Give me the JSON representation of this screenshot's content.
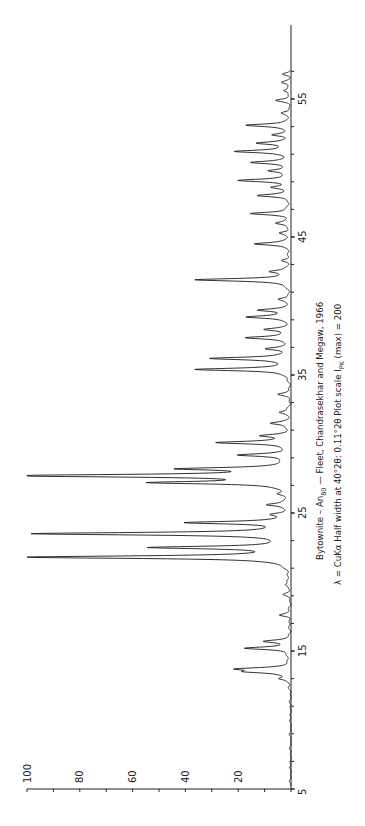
{
  "chart_data": {
    "type": "line",
    "orientation": "rotated-90-ccw",
    "title": "Bytownite – An80 — Fleet, Chandrasekhar and Megaw, 1966",
    "subtitle": "λ = CuKα  Half width at 40°2θ: 0.11°2θ   Plot scale I_PK (max) = 200",
    "xlabel": "2θ (degrees)",
    "ylabel": "Intensity",
    "xlim": [
      5,
      57.5
    ],
    "ylim": [
      0,
      100
    ],
    "x_ticks_major": [
      5,
      15,
      25,
      35,
      45,
      55
    ],
    "x_ticks_minor_step": 2,
    "y_ticks": [
      0,
      10,
      20,
      30,
      40,
      50,
      60,
      70,
      80,
      90,
      100
    ],
    "y_tick_labels": [
      "20",
      "40",
      "60",
      "80",
      "100"
    ],
    "y_tick_label_values": [
      20,
      40,
      60,
      80,
      100
    ],
    "grid": false,
    "legend": null,
    "peaks": [
      {
        "two_theta": 13.0,
        "intensity": 4
      },
      {
        "two_theta": 13.5,
        "intensity": 14
      },
      {
        "two_theta": 13.7,
        "intensity": 18
      },
      {
        "two_theta": 15.2,
        "intensity": 17
      },
      {
        "two_theta": 15.7,
        "intensity": 9
      },
      {
        "two_theta": 17.6,
        "intensity": 4
      },
      {
        "two_theta": 19.1,
        "intensity": 2
      },
      {
        "two_theta": 19.8,
        "intensity": 2
      },
      {
        "two_theta": 21.8,
        "intensity": 100
      },
      {
        "two_theta": 22.5,
        "intensity": 50
      },
      {
        "two_theta": 23.5,
        "intensity": 96
      },
      {
        "two_theta": 24.3,
        "intensity": 38
      },
      {
        "two_theta": 24.9,
        "intensity": 5
      },
      {
        "two_theta": 25.6,
        "intensity": 8
      },
      {
        "two_theta": 26.4,
        "intensity": 3
      },
      {
        "two_theta": 27.2,
        "intensity": 49
      },
      {
        "two_theta": 27.7,
        "intensity": 105,
        "clipped": true
      },
      {
        "two_theta": 28.2,
        "intensity": 38
      },
      {
        "two_theta": 29.2,
        "intensity": 18
      },
      {
        "two_theta": 30.1,
        "intensity": 27
      },
      {
        "two_theta": 30.6,
        "intensity": 10
      },
      {
        "two_theta": 31.5,
        "intensity": 7
      },
      {
        "two_theta": 32.3,
        "intensity": 4
      },
      {
        "two_theta": 33.6,
        "intensity": 4
      },
      {
        "two_theta": 35.4,
        "intensity": 36
      },
      {
        "two_theta": 36.2,
        "intensity": 30
      },
      {
        "two_theta": 36.9,
        "intensity": 8
      },
      {
        "two_theta": 37.7,
        "intensity": 17
      },
      {
        "two_theta": 38.3,
        "intensity": 9
      },
      {
        "two_theta": 39.2,
        "intensity": 16
      },
      {
        "two_theta": 39.7,
        "intensity": 12
      },
      {
        "two_theta": 40.5,
        "intensity": 4
      },
      {
        "two_theta": 41.9,
        "intensity": 36
      },
      {
        "two_theta": 42.5,
        "intensity": 7
      },
      {
        "two_theta": 43.3,
        "intensity": 3
      },
      {
        "two_theta": 44.5,
        "intensity": 14
      },
      {
        "two_theta": 45.3,
        "intensity": 4
      },
      {
        "two_theta": 46.0,
        "intensity": 5
      },
      {
        "two_theta": 46.7,
        "intensity": 15
      },
      {
        "two_theta": 48.0,
        "intensity": 12
      },
      {
        "two_theta": 48.6,
        "intensity": 6
      },
      {
        "two_theta": 49.1,
        "intensity": 19
      },
      {
        "two_theta": 49.8,
        "intensity": 8
      },
      {
        "two_theta": 50.4,
        "intensity": 14
      },
      {
        "two_theta": 51.2,
        "intensity": 21
      },
      {
        "two_theta": 51.8,
        "intensity": 12
      },
      {
        "two_theta": 52.4,
        "intensity": 6
      },
      {
        "two_theta": 53.1,
        "intensity": 17
      },
      {
        "two_theta": 54.0,
        "intensity": 3
      },
      {
        "two_theta": 54.9,
        "intensity": 5
      },
      {
        "two_theta": 55.6,
        "intensity": 3
      },
      {
        "two_theta": 56.2,
        "intensity": 3
      },
      {
        "two_theta": 56.8,
        "intensity": 3
      }
    ]
  },
  "caption": {
    "line1_main": "Bytownite – An",
    "line1_sub": "80",
    "line1_rest": " — Fleet, Chandrasekhar and Megaw, 1966",
    "line2_main": "λ = CuKα   Half width at 40°2θ: 0.11°2θ     Plot scale I",
    "line2_sub": "PK",
    "line2_rest": " (max) = 200"
  },
  "layout": {
    "origin_x": 291,
    "origin_y": 789,
    "px_per_intensity": 2.64,
    "px_per_degree": 13.8,
    "axis_top_y": 25
  },
  "colors": {
    "trace": "#1a1a1a",
    "axis": "#222222",
    "background": "#ffffff"
  }
}
